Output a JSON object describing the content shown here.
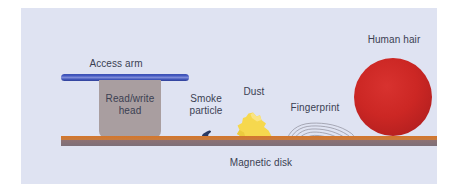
{
  "figure": {
    "panel_background": "#dfe3f2",
    "label_color": "#3b3f52"
  },
  "labels": {
    "access_arm": "Access arm",
    "read_write_head": "Read/write\nhead",
    "smoke_particle": "Smoke\nparticle",
    "dust": "Dust",
    "fingerprint": "Fingerprint",
    "human_hair": "Human hair",
    "magnetic_disk": "Magnetic disk"
  },
  "parts": {
    "access_arm": {
      "name": "access-arm",
      "color": "#3f54b8"
    },
    "read_write_head": {
      "name": "read-write-head",
      "color": "#a99ea0"
    },
    "magnetic_disk": {
      "name": "magnetic-disk",
      "top_color": "#d3762c",
      "body_color": "#8d7274"
    },
    "smoke_particle": {
      "name": "smoke-particle",
      "color": "#2b3a63"
    },
    "dust": {
      "name": "dust-particle",
      "color": "#f5d547"
    },
    "fingerprint": {
      "name": "fingerprint-ridges",
      "color": "#8a8a96"
    },
    "human_hair": {
      "name": "human-hair-cross-section",
      "color": "#cc2724"
    }
  }
}
